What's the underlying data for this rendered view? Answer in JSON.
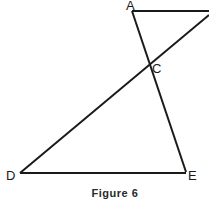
{
  "figure": {
    "caption": "Figure 6",
    "stroke_color": "#1a1a1a",
    "points": {
      "A": {
        "label": "A"
      },
      "C": {
        "label": "C"
      },
      "D": {
        "label": "D"
      },
      "E": {
        "label": "E"
      }
    },
    "segments": [
      {
        "name": "A-to-right",
        "from": "A",
        "to": "right-edge"
      },
      {
        "name": "AE",
        "from": "A",
        "to": "E"
      },
      {
        "name": "DC-extended",
        "from": "D",
        "to": "right-edge",
        "through": "C"
      },
      {
        "name": "DE",
        "from": "D",
        "to": "E"
      }
    ]
  }
}
